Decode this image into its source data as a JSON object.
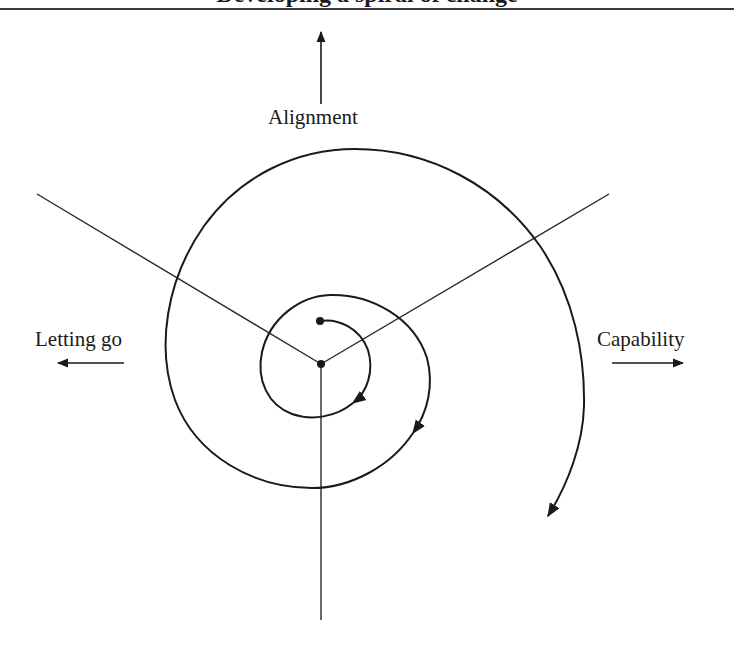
{
  "figure": {
    "heading_cut_off": "Developing a spiral of change",
    "labels": {
      "top": "Alignment",
      "left": "Letting go",
      "right": "Capability"
    },
    "arrows": {
      "top": "up",
      "left": "left",
      "right": "right"
    },
    "spiral": {
      "direction": "clockwise-outward",
      "turns": 3,
      "start_marker": "dot",
      "center_marker": "dot"
    },
    "radial_lines": [
      "upper-left",
      "upper-right",
      "down"
    ],
    "colors": {
      "stroke": "#1a1a1a",
      "background": "#ffffff"
    }
  }
}
